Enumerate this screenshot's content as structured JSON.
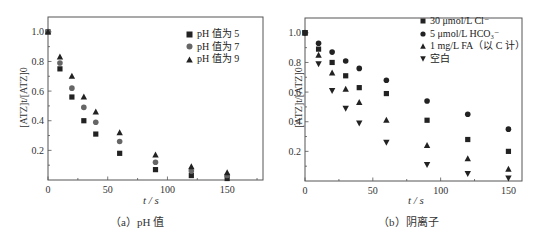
{
  "chart_data": [
    {
      "type": "scatter",
      "title": "",
      "caption": "（a）pH 值",
      "xlabel": "t / s",
      "ylabel": "[ATZ]t/[ATZ]0",
      "xlim": [
        0,
        180
      ],
      "ylim": [
        0,
        1.1
      ],
      "xticks": [
        0,
        50,
        100,
        150
      ],
      "yticks": [
        0.2,
        0.4,
        0.6,
        0.8,
        1.0
      ],
      "grid": false,
      "legend_position": "upper right",
      "x": [
        0,
        10,
        20,
        30,
        40,
        60,
        90,
        120,
        150
      ],
      "series": [
        {
          "name": "pH 值为 5",
          "marker": "square",
          "color": "#222222",
          "values": [
            1.0,
            0.75,
            0.56,
            0.4,
            0.31,
            0.18,
            0.07,
            0.03,
            0.01
          ]
        },
        {
          "name": "pH 值为 7",
          "marker": "circle",
          "color": "#666666",
          "values": [
            1.0,
            0.79,
            0.62,
            0.49,
            0.39,
            0.26,
            0.12,
            0.06,
            0.03
          ]
        },
        {
          "name": "pH 值为 9",
          "marker": "triangle-up",
          "color": "#222222",
          "values": [
            1.0,
            0.83,
            0.7,
            0.56,
            0.46,
            0.32,
            0.17,
            0.09,
            0.05
          ]
        }
      ]
    },
    {
      "type": "scatter",
      "title": "",
      "caption": "（b）阴离子",
      "xlabel": "t / s",
      "ylabel": "[ATZ]t/[ATZ]0",
      "xlim": [
        0,
        160
      ],
      "ylim": [
        0,
        1.1
      ],
      "xticks": [
        0,
        50,
        100,
        150
      ],
      "yticks": [
        0.2,
        0.4,
        0.6,
        0.8,
        1.0
      ],
      "grid": false,
      "legend_position": "upper right",
      "x": [
        0,
        10,
        20,
        30,
        40,
        60,
        90,
        120,
        150
      ],
      "series": [
        {
          "name": "30 μmol/L Cl⁻",
          "marker": "square",
          "color": "#222222",
          "values": [
            1.0,
            0.89,
            0.8,
            0.71,
            0.63,
            0.59,
            0.41,
            0.28,
            0.2
          ]
        },
        {
          "name": "5 μmol/L HCO₃⁻",
          "marker": "circle",
          "color": "#222222",
          "values": [
            1.0,
            0.93,
            0.87,
            0.81,
            0.76,
            0.68,
            0.54,
            0.45,
            0.35
          ]
        },
        {
          "name": "1 mg/L FA（以 C 计）",
          "marker": "triangle-up",
          "color": "#222222",
          "values": [
            1.0,
            0.85,
            0.73,
            0.62,
            0.53,
            0.41,
            0.24,
            0.15,
            0.08
          ]
        },
        {
          "name": "空白",
          "marker": "triangle-down",
          "color": "#222222",
          "values": [
            1.0,
            0.79,
            0.61,
            0.49,
            0.39,
            0.26,
            0.11,
            0.05,
            0.02
          ]
        }
      ]
    }
  ],
  "panels": {
    "a": {
      "caption": "（a）pH 值",
      "xlabel": "t / s",
      "ylabel": "[ATZ]t/[ATZ]0",
      "legend": [
        "pH 值为 5",
        "pH 值为 7",
        "pH 值为 9"
      ]
    },
    "b": {
      "caption": "（b）阴离子",
      "xlabel": "t / s",
      "ylabel": "[ATZ]t/[ATZ]0",
      "legend": [
        "30 μmol/L Cl⁻",
        "5 μmol/L HCO₃⁻",
        "1 mg/L FA（以 C 计）",
        "空白"
      ]
    }
  }
}
